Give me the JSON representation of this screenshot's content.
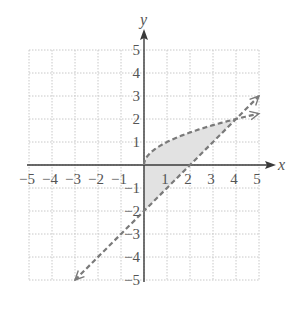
{
  "chart_data": {
    "type": "line",
    "title": "",
    "xlabel": "x",
    "ylabel": "y",
    "xlim": [
      -5,
      5
    ],
    "ylim": [
      -5,
      5
    ],
    "grid": true,
    "x_ticks": [
      -5,
      -4,
      -3,
      -2,
      -1,
      1,
      2,
      3,
      4,
      5
    ],
    "y_ticks": [
      5,
      4,
      3,
      2,
      1,
      -1,
      -2,
      -3,
      -4,
      -5
    ],
    "x_tick_labels": [
      "−5",
      "−4",
      "−3",
      "−2",
      "−1",
      "1",
      "2",
      "3",
      "4",
      "5"
    ],
    "y_tick_labels": [
      "5",
      "4",
      "3",
      "2",
      "1",
      "−1",
      "−2",
      "−3",
      "−4",
      "−5"
    ],
    "series": [
      {
        "name": "y = √x",
        "style": "dashed",
        "x": [
          0,
          0.25,
          1,
          2,
          3,
          4,
          5
        ],
        "y": [
          0,
          0.5,
          1,
          1.41,
          1.73,
          2,
          2.24
        ],
        "arrow_end": true
      },
      {
        "name": "y = x − 2",
        "style": "dashed",
        "x": [
          -3,
          -2,
          -1,
          0,
          1,
          2,
          3,
          4,
          5
        ],
        "y": [
          -5,
          -4,
          -3,
          -2,
          -1,
          0,
          1,
          2,
          3
        ],
        "arrow_start": true,
        "arrow_end": true
      }
    ],
    "shaded_region": {
      "description": "Region bounded by x = 0, y = √x and y = x − 2 for 0 ≤ x ≤ 4",
      "vertices": [
        [
          0,
          0
        ],
        [
          0,
          -2
        ],
        [
          4,
          2
        ]
      ],
      "fill": "#e2e2e2"
    }
  },
  "colors": {
    "axis": "#3a3a3a",
    "grid": "#c8c8c8",
    "curve": "#7a7a7a",
    "shade": "#e2e2e2",
    "text": "#555555"
  }
}
